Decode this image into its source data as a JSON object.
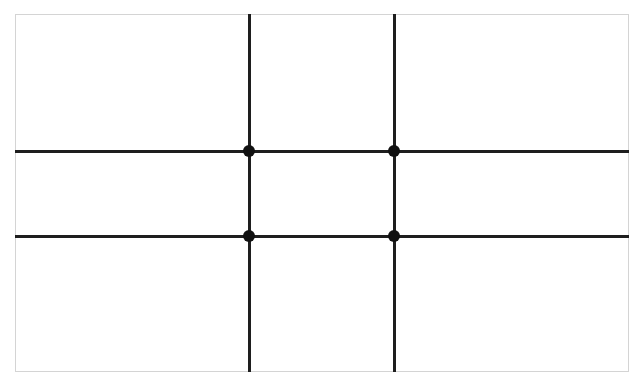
{
  "diagram": {
    "type": "rule-of-thirds-grid",
    "frame": {
      "x": 15,
      "y": 14,
      "width": 614,
      "height": 358,
      "border_color": "#d4d4d4"
    },
    "line_color": "#1e1e1e",
    "dot_color": "#111111",
    "vertical_lines_x": [
      249,
      394
    ],
    "horizontal_lines_y": [
      151,
      236
    ],
    "intersections": [
      {
        "x": 249,
        "y": 151
      },
      {
        "x": 394,
        "y": 151
      },
      {
        "x": 249,
        "y": 236
      },
      {
        "x": 394,
        "y": 236
      }
    ]
  }
}
